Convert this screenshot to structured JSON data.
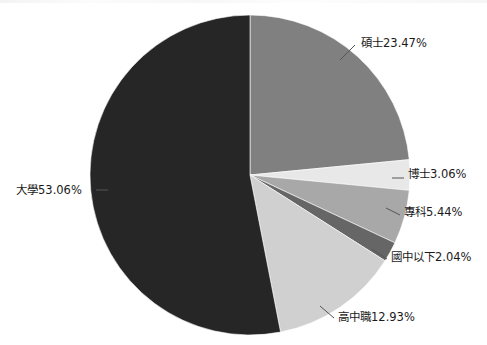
{
  "figure": {
    "background_color": "#ffffff",
    "has_title": false,
    "has_legend": false,
    "has_axes": false
  },
  "chart_data": {
    "type": "pie",
    "title": "",
    "xlabel": "",
    "ylabel": "",
    "legend_position": "none",
    "grid": false,
    "label_format": "{category}{value}%",
    "start_angle_deg": 90,
    "direction": "clockwise",
    "categories": [
      "碩士",
      "博士",
      "專科",
      "國中以下",
      "高中職",
      "大學"
    ],
    "values": [
      23.47,
      3.06,
      5.44,
      2.04,
      12.93,
      53.06
    ],
    "colors": [
      "#808080",
      "#e8e8e8",
      "#a8a8a8",
      "#666666",
      "#d0d0d0",
      "#262626"
    ],
    "labels": [
      "碩士23.47%",
      "博士3.06%",
      "專科5.44%",
      "國中以下2.04%",
      "高中職12.93%",
      "大學53.06%"
    ],
    "slices": [
      {
        "category": "碩士",
        "value": 23.47,
        "label": "碩士23.47%",
        "color": "#808080"
      },
      {
        "category": "博士",
        "value": 3.06,
        "label": "博士3.06%",
        "color": "#e8e8e8"
      },
      {
        "category": "專科",
        "value": 5.44,
        "label": "專科5.44%",
        "color": "#a8a8a8"
      },
      {
        "category": "國中以下",
        "value": 2.04,
        "label": "國中以下2.04%",
        "color": "#666666"
      },
      {
        "category": "高中職",
        "value": 12.93,
        "label": "高中職12.93%",
        "color": "#d0d0d0"
      },
      {
        "category": "大學",
        "value": 53.06,
        "label": "大學53.06%",
        "color": "#262626"
      }
    ]
  },
  "geometry": {
    "cx": 250,
    "cy": 175,
    "r": 160,
    "label_positions": [
      {
        "x": 361,
        "y": 47,
        "anchor": "start",
        "lx1": 340,
        "ly1": 60,
        "lx2": 355,
        "ly2": 45
      },
      {
        "x": 408,
        "y": 178,
        "anchor": "start",
        "lx1": 392,
        "ly1": 178,
        "lx2": 404,
        "ly2": 178
      },
      {
        "x": 404,
        "y": 216,
        "anchor": "start",
        "lx1": 386,
        "ly1": 208,
        "lx2": 400,
        "ly2": 215
      },
      {
        "x": 391,
        "y": 261,
        "anchor": "start",
        "lx1": 372,
        "ly1": 249,
        "lx2": 387,
        "ly2": 259
      },
      {
        "x": 338,
        "y": 321,
        "anchor": "start",
        "lx1": 320,
        "ly1": 306,
        "lx2": 334,
        "ly2": 318
      },
      {
        "x": 16,
        "y": 194,
        "anchor": "start",
        "lx1": 96,
        "ly1": 190,
        "lx2": 108,
        "ly2": 190
      }
    ]
  }
}
